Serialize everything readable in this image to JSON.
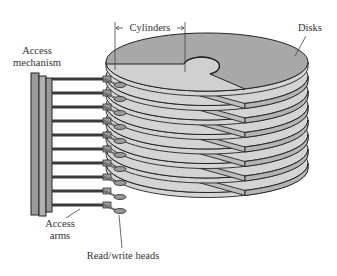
{
  "diagram": {
    "labels": {
      "access_mechanism_line1": "Access",
      "access_mechanism_line2": "mechanism",
      "cylinders": "Cylinders",
      "disks": "Disks",
      "access_arms_line1": "Access",
      "access_arms_line2": "arms",
      "read_write_heads": "Read/write heads"
    },
    "components": {
      "disk_count": 8,
      "access_arm_count": 10,
      "read_write_head_count": 10
    },
    "colors": {
      "disk_top": "#a8a8a8",
      "disk_side": "#d4d4d4",
      "disk_cut_face": "#bcbcbc",
      "outline": "#222222",
      "mechanism": "#9a9a9a",
      "arm": "#3a3a3a"
    }
  }
}
